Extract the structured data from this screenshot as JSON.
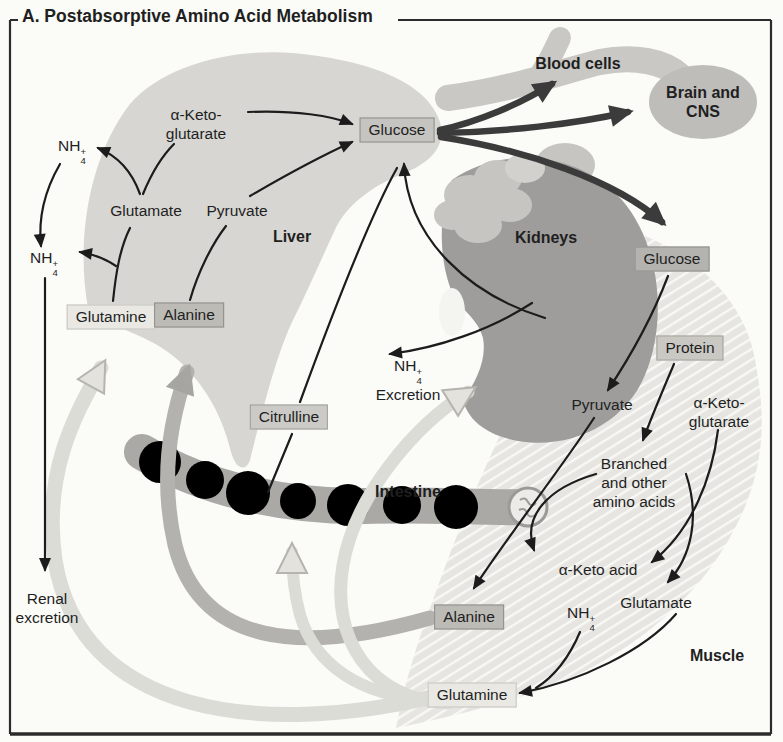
{
  "title": "A. Postabsorptive Amino Acid Metabolism",
  "chem": {
    "base": "NH",
    "sub": "4",
    "sup": "+"
  },
  "organs": {
    "liver": "Liver",
    "kidneys": "Kidneys",
    "intestine": "Intestine",
    "muscle": "Muscle",
    "blood_cells": "Blood cells",
    "brain_line1": "Brain and",
    "brain_line2": "CNS"
  },
  "boxes": {
    "glucose_liver": "Glucose",
    "glucose_muscle": "Glucose",
    "glutamine_liver": "Glutamine",
    "alanine_liver": "Alanine",
    "citrulline": "Citrulline",
    "protein": "Protein",
    "alanine_muscle": "Alanine",
    "glutamine_muscle": "Glutamine"
  },
  "labels": {
    "glutamate_liver": "Glutamate",
    "pyruvate_liver": "Pyruvate",
    "akg_line1": "α-Keto-",
    "akg_line2": "glutarate",
    "excretion": "Excretion",
    "renal_line1": "Renal",
    "renal_line2": "excretion",
    "pyruvate_muscle": "Pyruvate",
    "akg_muscle_line1": "α-Keto-",
    "akg_muscle_line2": "glutarate",
    "branched_line1": "Branched",
    "branched_line2": "and other",
    "branched_line3": "amino acids",
    "keto_acid": "α-Keto acid",
    "glutamate_muscle": "Glutamate"
  },
  "colors": {
    "background": "#fbfbf8",
    "frame": "#2b2b2b",
    "liver": "#d7d6d2",
    "kidney": "#9e9d9b",
    "adrenal": "#c6c5c1",
    "intestine": "#aaa9a6",
    "muscle": "#e6e5e1",
    "muscle_stripe": "#f8f8f5",
    "vessel": "#c9c8c5",
    "brain": "#bebdba",
    "arrow_thin": "#1c1c1c",
    "arrow_thick": "#3b3b3b",
    "band_alanine": "#b3b2ae",
    "band_glutamine": "#dcdcd7",
    "box_glucose_liver_bg": "#c5c4c0",
    "box_glucose_muscle_bg": "#b4b3af",
    "box_protein_bg": "#c9c8c3",
    "box_citrulline_bg": "#cbcac6",
    "box_glutamine_bg": "#e9e8e3",
    "box_alanine_bg": "#bcbbb6",
    "box_border_dark": "#8f8e8a",
    "box_border_light": "#c5c4be",
    "text": "#1f1f1f"
  }
}
